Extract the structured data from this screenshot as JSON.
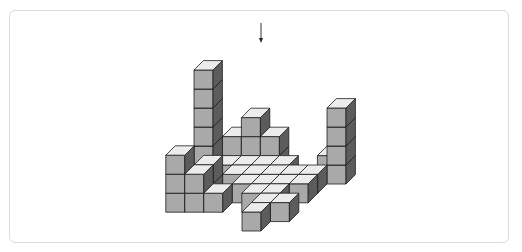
{
  "figure": {
    "arrow": {
      "x": 261,
      "y1": 23,
      "y2": 43,
      "direction": "down"
    },
    "colors": {
      "top_face": "#ececec",
      "front_face": "#a9a9a9",
      "side_face": "#5c5c5c",
      "outline": "#1e1e1e",
      "frame_border": "#dcdcdc"
    },
    "projection": {
      "origin_x": 147,
      "origin_y": 231,
      "unit": 19,
      "depth_dx": 9.4,
      "depth_dy": 9.4
    },
    "stacks": [
      {
        "c": 0,
        "r": 5,
        "h": 6
      },
      {
        "c": 0,
        "r": 2,
        "h": 3
      },
      {
        "c": 1,
        "r": 2,
        "h": 2
      },
      {
        "c": 1,
        "r": 3,
        "h": 2
      },
      {
        "c": 2,
        "r": 2,
        "h": 1
      },
      {
        "c": 1,
        "r": 6,
        "h": 2
      },
      {
        "c": 2,
        "r": 6,
        "h": 3
      },
      {
        "c": 3,
        "r": 6,
        "h": 2
      },
      {
        "c": 1,
        "r": 5,
        "h": 1
      },
      {
        "c": 2,
        "r": 5,
        "h": 1
      },
      {
        "c": 3,
        "r": 5,
        "h": 1
      },
      {
        "c": 4,
        "r": 5,
        "h": 1
      },
      {
        "c": 2,
        "r": 4,
        "h": 1
      },
      {
        "c": 3,
        "r": 4,
        "h": 1
      },
      {
        "c": 4,
        "r": 4,
        "h": 1
      },
      {
        "c": 3,
        "r": 3,
        "h": 1
      },
      {
        "c": 6,
        "r": 6,
        "h": 1
      },
      {
        "c": 7,
        "r": 5,
        "h": 4
      },
      {
        "c": 5,
        "r": 4,
        "h": 1
      },
      {
        "c": 6,
        "r": 4,
        "h": 1
      },
      {
        "c": 4,
        "r": 3,
        "h": 1
      },
      {
        "c": 5,
        "r": 3,
        "h": 1
      },
      {
        "c": 6,
        "r": 3,
        "h": 1
      },
      {
        "c": 4,
        "r": 2,
        "h": 1
      },
      {
        "c": 5,
        "r": 2,
        "h": 1
      },
      {
        "c": 5,
        "r": 1,
        "h": 1
      },
      {
        "c": 6,
        "r": 1,
        "h": 1
      },
      {
        "c": 5,
        "r": 0,
        "h": 1
      }
    ]
  }
}
